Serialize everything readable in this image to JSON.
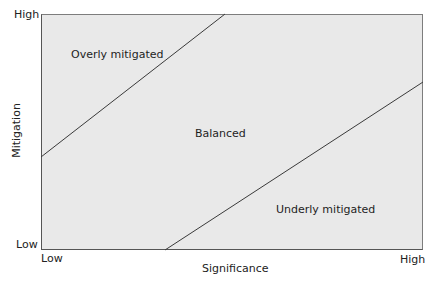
{
  "diagram": {
    "x_axis": {
      "label": "Significance",
      "low": "Low",
      "high": "High"
    },
    "y_axis": {
      "label": "Mitigation",
      "low": "Low",
      "high": "High"
    },
    "regions": [
      {
        "name": "overly",
        "label": "Overly mitigated"
      },
      {
        "name": "balanced",
        "label": "Balanced"
      },
      {
        "name": "underly",
        "label": "Underly mitigated"
      }
    ],
    "boundaries": [
      {
        "name": "upper",
        "from": [
          0,
          0.39
        ],
        "to": [
          0.48,
          1.0
        ]
      },
      {
        "name": "lower",
        "from": [
          0.32,
          0.0
        ],
        "to": [
          1.0,
          0.71
        ]
      }
    ],
    "colors": {
      "plot_bg": "#e9e9e9",
      "line": "#3a3a3a",
      "frame": "#555555"
    }
  }
}
